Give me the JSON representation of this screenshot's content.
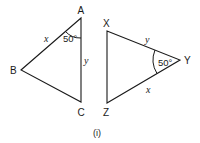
{
  "figure": {
    "caption": "(i)",
    "stroke_color": "#1a1a1a",
    "triangle_abc": {
      "vertices": {
        "A": "A",
        "B": "B",
        "C": "C"
      },
      "sides": {
        "AB": "x",
        "AC": "y"
      },
      "angle_at_A": "50°"
    },
    "triangle_xyz": {
      "vertices": {
        "X": "X",
        "Y": "Y",
        "Z": "Z"
      },
      "sides": {
        "XY": "y",
        "YZ": "x"
      },
      "angle_at_Y": "50°"
    }
  }
}
